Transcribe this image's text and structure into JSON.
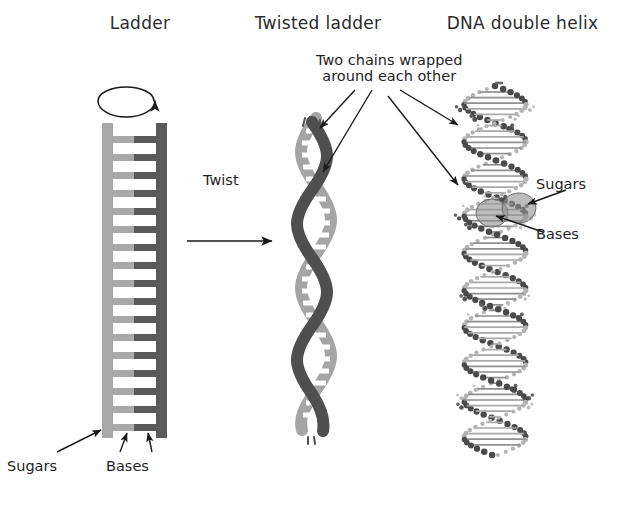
{
  "figure": {
    "background_color": "#ffffff"
  },
  "panels": {
    "ladder": {
      "title": "Ladder",
      "labels": {
        "sugars": "Sugars",
        "bases": "Bases"
      },
      "icons": {
        "rotation": "rotation-arrow-icon",
        "sugars_pointer": "arrow-icon",
        "bases_pointer_left": "arrow-icon",
        "bases_pointer_right": "arrow-icon"
      },
      "colors": {
        "left_rail": "#a8a8a8",
        "right_rail": "#5a5a5a",
        "rung_left_half": "#a8a8a8",
        "rung_right_half": "#5a5a5a"
      },
      "rung_count": 17
    },
    "twist_step": {
      "label": "Twist",
      "icon": "right-arrow-icon"
    },
    "twisted_ladder": {
      "title": "Twisted ladder",
      "colors": {
        "front_strand": "#4f4f4f",
        "back_strand": "#a5a5a5",
        "rungs": "#ffffff"
      },
      "turns": 5
    },
    "double_helix": {
      "title": "DNA double helix",
      "labels": {
        "sugars": "Sugars",
        "bases": "Bases"
      },
      "icons": {
        "sugars_pointer": "arrow-icon",
        "bases_pointer": "arrow-icon",
        "sugar_highlight": "ellipse-highlight-icon",
        "base_highlight": "ellipse-highlight-icon"
      },
      "colors": {
        "atoms_dark": "#4a4a4a",
        "atoms_light": "#b0b0b0",
        "highlight": "#9a9a9a"
      }
    }
  },
  "callout": {
    "line1": "Two chains wrapped",
    "line2": "around each other",
    "arrow_count": 4,
    "icons": {
      "arrow_to_twisted_top": "arrow-icon",
      "arrow_to_twisted_mid": "arrow-icon",
      "arrow_to_helix_top": "arrow-icon",
      "arrow_to_helix_mid": "arrow-icon"
    }
  }
}
